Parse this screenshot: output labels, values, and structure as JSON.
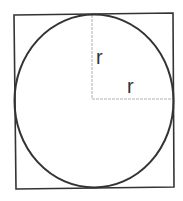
{
  "diagram": {
    "labels": {
      "vertical_radius": "r",
      "horizontal_radius": "r"
    },
    "colors": {
      "outline": "#333333",
      "radius_lines": "#b0b0b0",
      "background": "#ffffff"
    }
  }
}
